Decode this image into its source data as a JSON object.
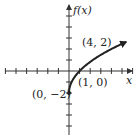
{
  "chart_data": {
    "type": "line",
    "title": "",
    "xlabel": "x",
    "ylabel": "f(x)",
    "function": "f(x) = 2√x − 2",
    "series": [
      {
        "name": "f(x)",
        "x": [
          0,
          0.25,
          0.5,
          1,
          1.5,
          2,
          2.5,
          3,
          3.5,
          4,
          4.5,
          5,
          5.4
        ],
        "values": [
          -2,
          -1,
          -0.586,
          0,
          0.449,
          0.828,
          1.162,
          1.464,
          1.742,
          2,
          2.243,
          2.472,
          2.648
        ]
      }
    ],
    "annotations": [
      {
        "label": "(4, 2)",
        "x": 4,
        "y": 2
      },
      {
        "label": "(1, 0)",
        "x": 1,
        "y": 0
      },
      {
        "label": "(0, −2)",
        "x": 0,
        "y": -2
      }
    ],
    "xlim": [
      -6,
      6
    ],
    "ylim": [
      -6,
      6
    ],
    "grid": false,
    "legend": "none",
    "tick_spacing": 1,
    "endpoint": {
      "x": 0,
      "y": -2,
      "style": "closed-dot"
    },
    "arrow_end": true
  },
  "labels": {
    "y_axis": "f(x)",
    "x_axis": "x",
    "point_a": "(4, 2)",
    "point_b": "(1, 0)",
    "point_c": "(0, −2)"
  }
}
